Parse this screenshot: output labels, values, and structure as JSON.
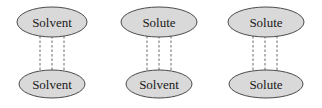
{
  "diagram": {
    "type": "intermolecular-interaction-pairs",
    "colors": {
      "ellipse_fill": "#d9d9d9",
      "ellipse_stroke": "#4a4a4a",
      "dashed_line": "#6a6a6a",
      "text": "#1a1a1a"
    },
    "pairs": [
      {
        "top": {
          "label": "Solvent"
        },
        "bottom": {
          "label": "Solvent"
        },
        "interaction": "dashed-lines-3"
      },
      {
        "top": {
          "label": "Solute"
        },
        "bottom": {
          "label": "Solvent"
        },
        "interaction": "dashed-lines-3"
      },
      {
        "top": {
          "label": "Solute"
        },
        "bottom": {
          "label": "Solute"
        },
        "interaction": "dashed-lines-3"
      }
    ]
  }
}
